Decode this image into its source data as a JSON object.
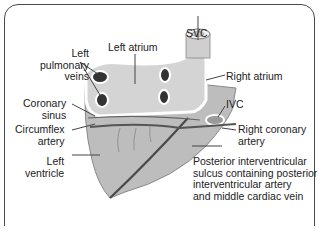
{
  "diagram": {
    "labels": {
      "left_pulmonary_veins": [
        "Left",
        "pulmonary",
        "veins"
      ],
      "left_atrium": "Left atrium",
      "svc": "SVC",
      "right_atrium": "Right atrium",
      "coronary_sinus": [
        "Coronary",
        "sinus"
      ],
      "ivc": "IVC",
      "circumflex_artery": [
        "Circumflex",
        "artery"
      ],
      "right_coronary_artery": [
        "Right coronary",
        "artery"
      ],
      "left_ventricle": [
        "Left",
        "ventricle"
      ],
      "posterior_sulcus": [
        "Posterior interventricular",
        "sulcus containing posterior",
        "interventricular artery",
        "and middle cardiac vein"
      ]
    },
    "colors": {
      "border": "#4a4a4a",
      "heart_fill": "#bdbdbd",
      "atria_fill": "#d4d4d4",
      "vessel_outline": "#ffffff",
      "vein_lumen": "#333333",
      "artery_line": "#555555",
      "text": "#222222"
    }
  }
}
